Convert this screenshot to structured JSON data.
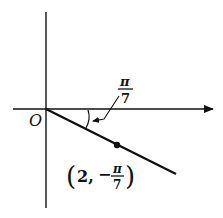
{
  "diagram": {
    "type": "polar-coordinate-point",
    "origin_label": "O",
    "angle_label": {
      "numerator": "π",
      "denominator": "7"
    },
    "point_label": {
      "open": "(",
      "r": "2,",
      "sign": "−",
      "numerator": "π",
      "denominator": "7",
      "close": ")"
    },
    "point": {
      "r": 2,
      "theta": "-π/7"
    },
    "colors": {
      "stroke": "#111111",
      "background": "#ffffff"
    }
  }
}
